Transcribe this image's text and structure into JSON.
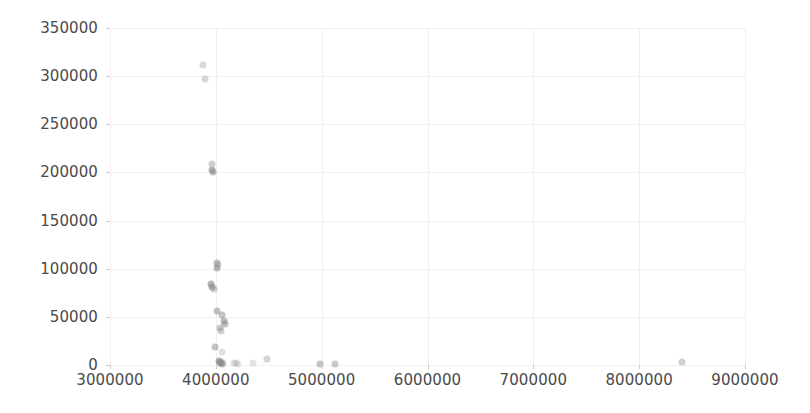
{
  "chart_data": {
    "type": "scatter",
    "title": "",
    "xlabel": "",
    "ylabel": "",
    "xlim": [
      3000000,
      9000000
    ],
    "ylim": [
      0,
      350000
    ],
    "xticks": [
      3000000,
      4000000,
      5000000,
      6000000,
      7000000,
      8000000,
      9000000
    ],
    "xtick_labels": [
      "3000000",
      "4000000",
      "5000000",
      "6000000",
      "7000000",
      "8000000",
      "9000000"
    ],
    "yticks": [
      0,
      50000,
      100000,
      150000,
      200000,
      250000,
      300000,
      350000
    ],
    "ytick_labels": [
      "0",
      "50000",
      "100000",
      "150000",
      "200000",
      "250000",
      "300000",
      "350000"
    ],
    "grid": true,
    "legend": null,
    "marker_color": "#8c8c8c",
    "marker_size": 7,
    "points": [
      {
        "x": 3880000,
        "y": 312000,
        "opacity": 0.33
      },
      {
        "x": 3900000,
        "y": 297000,
        "opacity": 0.36
      },
      {
        "x": 3960000,
        "y": 209000,
        "opacity": 0.42
      },
      {
        "x": 3965000,
        "y": 203000,
        "opacity": 0.62
      },
      {
        "x": 3972000,
        "y": 200500,
        "opacity": 0.58
      },
      {
        "x": 4010000,
        "y": 106000,
        "opacity": 0.55
      },
      {
        "x": 4015000,
        "y": 101000,
        "opacity": 0.6
      },
      {
        "x": 4022000,
        "y": 104000,
        "opacity": 0.34
      },
      {
        "x": 3950000,
        "y": 84000,
        "opacity": 0.62
      },
      {
        "x": 3962000,
        "y": 80500,
        "opacity": 0.66
      },
      {
        "x": 3978000,
        "y": 79000,
        "opacity": 0.4
      },
      {
        "x": 4010000,
        "y": 56000,
        "opacity": 0.55
      },
      {
        "x": 4062000,
        "y": 52000,
        "opacity": 0.5
      },
      {
        "x": 4078000,
        "y": 46000,
        "opacity": 0.58
      },
      {
        "x": 4085000,
        "y": 43000,
        "opacity": 0.55
      },
      {
        "x": 4042000,
        "y": 38000,
        "opacity": 0.48
      },
      {
        "x": 4048000,
        "y": 35000,
        "opacity": 0.4
      },
      {
        "x": 3995000,
        "y": 19000,
        "opacity": 0.52
      },
      {
        "x": 4060000,
        "y": 13000,
        "opacity": 0.26
      },
      {
        "x": 4028000,
        "y": 4000,
        "opacity": 0.68
      },
      {
        "x": 4038000,
        "y": 2500,
        "opacity": 0.62
      },
      {
        "x": 4050000,
        "y": 3500,
        "opacity": 0.45
      },
      {
        "x": 4055000,
        "y": 1500,
        "opacity": 0.58
      },
      {
        "x": 4070000,
        "y": 2000,
        "opacity": 0.3
      },
      {
        "x": 4175000,
        "y": 2500,
        "opacity": 0.22
      },
      {
        "x": 4195000,
        "y": 2000,
        "opacity": 0.26
      },
      {
        "x": 4210000,
        "y": 1500,
        "opacity": 0.2
      },
      {
        "x": 4350000,
        "y": 2500,
        "opacity": 0.24
      },
      {
        "x": 4480000,
        "y": 6000,
        "opacity": 0.36
      },
      {
        "x": 4985000,
        "y": 1500,
        "opacity": 0.5
      },
      {
        "x": 5130000,
        "y": 1500,
        "opacity": 0.45
      },
      {
        "x": 8400000,
        "y": 3000,
        "opacity": 0.42
      }
    ]
  }
}
